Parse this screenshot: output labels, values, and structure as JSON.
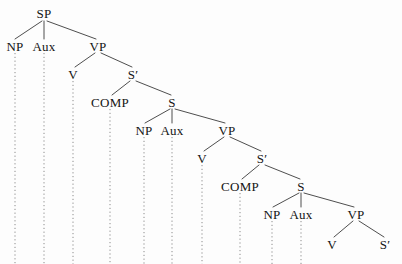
{
  "figure": {
    "type": "syntax-tree-diagram",
    "width": 402,
    "height": 264,
    "background_color": "#fdfdfd",
    "line_color": "#3a3a3a",
    "trace_line_color": "#8c8c8c",
    "text_color": "#141414"
  },
  "nodes": [
    {
      "id": "n1",
      "label": "SP",
      "x": 44,
      "y": 13,
      "style": "normal"
    },
    {
      "id": "n2",
      "label": "NP",
      "x": 15,
      "y": 46,
      "style": "normal"
    },
    {
      "id": "n3",
      "label": "Aux",
      "x": 44,
      "y": 46,
      "style": "normal"
    },
    {
      "id": "n4",
      "label": "VP",
      "x": 98,
      "y": 46,
      "style": "normal"
    },
    {
      "id": "n5",
      "label": "V",
      "x": 73,
      "y": 74,
      "style": "normal"
    },
    {
      "id": "n6",
      "label": "Sʹ",
      "x": 133,
      "y": 74,
      "style": "normal"
    },
    {
      "id": "n7",
      "label": "COMP",
      "x": 110,
      "y": 102,
      "style": "smallcaps"
    },
    {
      "id": "n8",
      "label": "S",
      "x": 172,
      "y": 102,
      "style": "normal"
    },
    {
      "id": "n9",
      "label": "NP",
      "x": 144,
      "y": 130,
      "style": "normal"
    },
    {
      "id": "n10",
      "label": "Aux",
      "x": 172,
      "y": 130,
      "style": "normal"
    },
    {
      "id": "n11",
      "label": "VP",
      "x": 227,
      "y": 130,
      "style": "normal"
    },
    {
      "id": "n12",
      "label": "V",
      "x": 202,
      "y": 158,
      "style": "normal"
    },
    {
      "id": "n13",
      "label": "Sʹ",
      "x": 262,
      "y": 158,
      "style": "normal"
    },
    {
      "id": "n14",
      "label": "COMP",
      "x": 240,
      "y": 186,
      "style": "smallcaps"
    },
    {
      "id": "n15",
      "label": "S",
      "x": 301,
      "y": 186,
      "style": "normal"
    },
    {
      "id": "n16",
      "label": "NP",
      "x": 272,
      "y": 214,
      "style": "normal"
    },
    {
      "id": "n17",
      "label": "Aux",
      "x": 301,
      "y": 214,
      "style": "normal"
    },
    {
      "id": "n18",
      "label": "VP",
      "x": 356,
      "y": 214,
      "style": "normal"
    },
    {
      "id": "n19",
      "label": "V",
      "x": 332,
      "y": 244,
      "style": "normal"
    },
    {
      "id": "n20",
      "label": "Sʹ",
      "x": 385,
      "y": 244,
      "style": "normal"
    }
  ],
  "branches": [
    {
      "from": "n1",
      "to": "n2",
      "x1": 42,
      "y1": 21,
      "x2": 15,
      "y2": 39
    },
    {
      "from": "n1",
      "to": "n3",
      "x1": 44,
      "y1": 21,
      "x2": 44,
      "y2": 39
    },
    {
      "from": "n1",
      "to": "n4",
      "x1": 47,
      "y1": 21,
      "x2": 96,
      "y2": 39
    },
    {
      "from": "n4",
      "to": "n5",
      "x1": 95,
      "y1": 53,
      "x2": 75,
      "y2": 67
    },
    {
      "from": "n4",
      "to": "n6",
      "x1": 101,
      "y1": 53,
      "x2": 132,
      "y2": 67
    },
    {
      "from": "n6",
      "to": "n7",
      "x1": 130,
      "y1": 81,
      "x2": 112,
      "y2": 95
    },
    {
      "from": "n6",
      "to": "n8",
      "x1": 136,
      "y1": 81,
      "x2": 171,
      "y2": 95
    },
    {
      "from": "n8",
      "to": "n9",
      "x1": 170,
      "y1": 109,
      "x2": 145,
      "y2": 123
    },
    {
      "from": "n8",
      "to": "n10",
      "x1": 172,
      "y1": 109,
      "x2": 172,
      "y2": 123
    },
    {
      "from": "n8",
      "to": "n11",
      "x1": 175,
      "y1": 109,
      "x2": 225,
      "y2": 123
    },
    {
      "from": "n11",
      "to": "n12",
      "x1": 224,
      "y1": 137,
      "x2": 204,
      "y2": 151
    },
    {
      "from": "n11",
      "to": "n13",
      "x1": 230,
      "y1": 137,
      "x2": 261,
      "y2": 151
    },
    {
      "from": "n13",
      "to": "n14",
      "x1": 259,
      "y1": 165,
      "x2": 242,
      "y2": 179
    },
    {
      "from": "n13",
      "to": "n15",
      "x1": 265,
      "y1": 165,
      "x2": 300,
      "y2": 179
    },
    {
      "from": "n15",
      "to": "n16",
      "x1": 299,
      "y1": 193,
      "x2": 273,
      "y2": 207
    },
    {
      "from": "n15",
      "to": "n17",
      "x1": 301,
      "y1": 193,
      "x2": 301,
      "y2": 207
    },
    {
      "from": "n15",
      "to": "n18",
      "x1": 304,
      "y1": 193,
      "x2": 354,
      "y2": 207
    },
    {
      "from": "n18",
      "to": "n19",
      "x1": 353,
      "y1": 221,
      "x2": 334,
      "y2": 237
    },
    {
      "from": "n18",
      "to": "n20",
      "x1": 359,
      "y1": 221,
      "x2": 384,
      "y2": 237
    }
  ],
  "trace_lines": [
    {
      "from": "n2",
      "x": 15,
      "y1": 53,
      "y2": 264
    },
    {
      "from": "n3",
      "x": 44,
      "y1": 53,
      "y2": 264
    },
    {
      "from": "n5",
      "x": 73,
      "y1": 81,
      "y2": 264
    },
    {
      "from": "n7",
      "x": 110,
      "y1": 109,
      "y2": 264
    },
    {
      "from": "n9",
      "x": 144,
      "y1": 137,
      "y2": 264
    },
    {
      "from": "n10",
      "x": 172,
      "y1": 137,
      "y2": 264
    },
    {
      "from": "n12",
      "x": 202,
      "y1": 165,
      "y2": 264
    },
    {
      "from": "n14",
      "x": 240,
      "y1": 193,
      "y2": 264
    },
    {
      "from": "n16",
      "x": 272,
      "y1": 221,
      "y2": 264
    },
    {
      "from": "n17",
      "x": 301,
      "y1": 221,
      "y2": 264
    }
  ]
}
